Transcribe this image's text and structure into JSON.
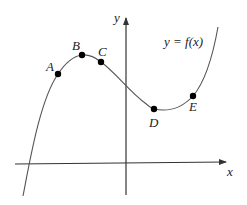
{
  "diagram": {
    "function_label": "y = f(x)",
    "axes": {
      "x_label": "x",
      "y_label": "y"
    },
    "points": [
      {
        "label": "A",
        "x": 58,
        "y": 74
      },
      {
        "label": "B",
        "x": 82,
        "y": 55
      },
      {
        "label": "C",
        "x": 101,
        "y": 62
      },
      {
        "label": "D",
        "x": 154,
        "y": 109
      },
      {
        "label": "E",
        "x": 193,
        "y": 96
      }
    ],
    "colors": {
      "curve": "#555555",
      "axis": "#333333",
      "point": "#000000"
    }
  }
}
